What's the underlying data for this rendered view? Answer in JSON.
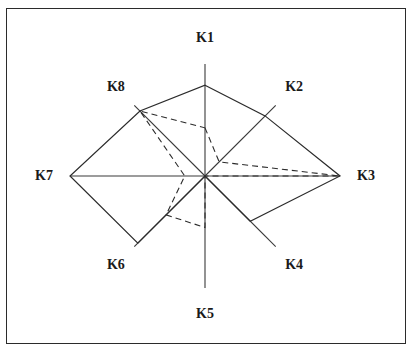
{
  "figure": {
    "background_color": "#ffffff",
    "border_color": "#2b2b2b",
    "axis_color": "#3a3a3a",
    "series_solid_color": "#2b2b2b",
    "series_dashed_color": "#2b2b2b"
  },
  "labels": {
    "k1": "K1",
    "k2": "K2",
    "k3": "K3",
    "k4": "K4",
    "k5": "K5",
    "k6": "K6",
    "k7": "K7",
    "k8": "K8"
  },
  "chart_data": {
    "type": "radar",
    "title": "",
    "xlabel": "",
    "ylabel": "",
    "grid": false,
    "legend": "none",
    "tick_labels": [],
    "axis_range": [
      0,
      1
    ],
    "categories": [
      "K1",
      "K2",
      "K3",
      "K4",
      "K5",
      "K6",
      "K7",
      "K8"
    ],
    "category_angles_deg": [
      90,
      45,
      0,
      315,
      270,
      225,
      180,
      135
    ],
    "series": [
      {
        "name": "Series 1",
        "style": "solid",
        "values": [
          0.81,
          0.85,
          1.0,
          0.64,
          0.0,
          0.95,
          1.0,
          0.92
        ]
      },
      {
        "name": "Series 2",
        "style": "dashed",
        "values": [
          0.43,
          0.2,
          1.0,
          0.0,
          0.46,
          0.55,
          0.15,
          0.92
        ]
      }
    ]
  },
  "geometry": {
    "center_x": 205,
    "center_y": 176,
    "radius_vertical": 112,
    "radius_horizontal": 135,
    "radius_diagonal": 100,
    "label_offset": 26
  }
}
